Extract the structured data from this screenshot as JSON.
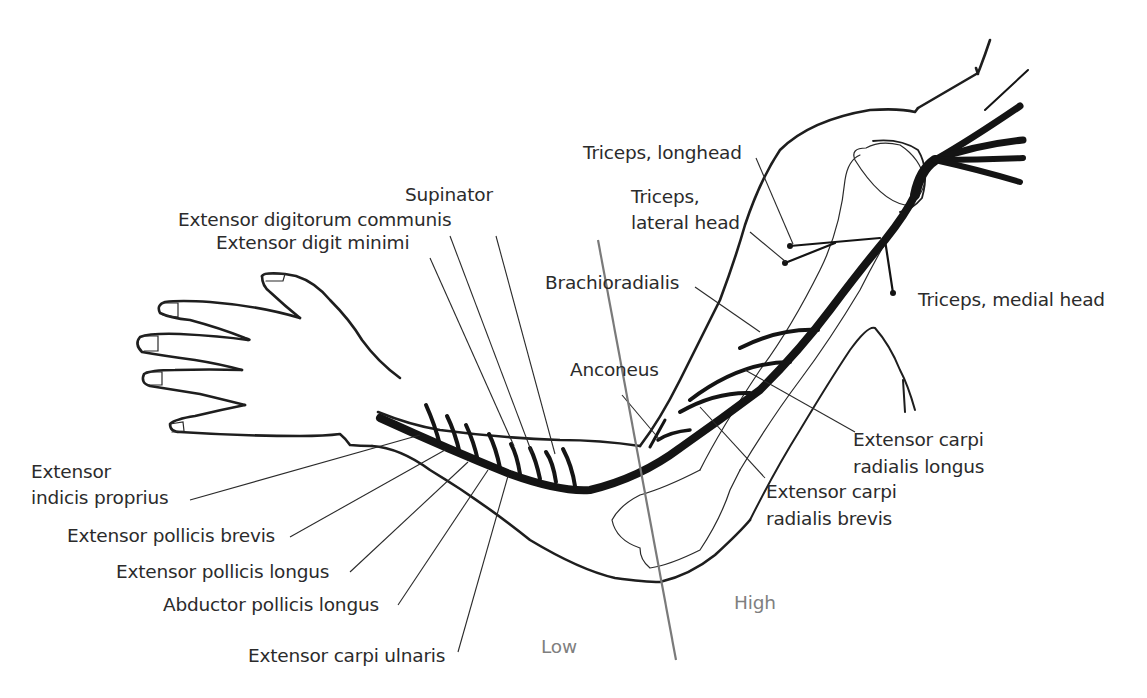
{
  "diagram": {
    "labels": {
      "triceps_longhead": "Triceps, longhead",
      "triceps_lateral_line1": "Triceps,",
      "triceps_lateral_line2": "lateral head",
      "triceps_medial": "Triceps, medial head",
      "supinator": "Supinator",
      "ext_digitorum_communis": "Extensor digitorum communis",
      "ext_digit_minimi": "Extensor digit minimi",
      "brachioradialis": "Brachioradialis",
      "anconeus": "Anconeus",
      "ecr_longus_line1": "Extensor carpi",
      "ecr_longus_line2": "radialis longus",
      "ecr_brevis_line1": "Extensor carpi",
      "ecr_brevis_line2": "radialis brevis",
      "ext_indicis_line1": "Extensor",
      "ext_indicis_line2": "indicis proprius",
      "ext_pollicis_brevis": "Extensor pollicis brevis",
      "ext_pollicis_longus": "Extensor pollicis longus",
      "abductor_pollicis_longus": "Abductor pollicis longus",
      "ext_carpi_ulnaris": "Extensor carpi ulnaris"
    },
    "level_markers": {
      "low": "Low",
      "high": "High"
    },
    "colors": {
      "outline": "#1e1e1e",
      "nerve": "#141414",
      "leader": "#2a2a2a",
      "level_line": "#7a7a7a",
      "level_text": "#7f7f7f",
      "label_text": "#2b2b2b"
    }
  }
}
